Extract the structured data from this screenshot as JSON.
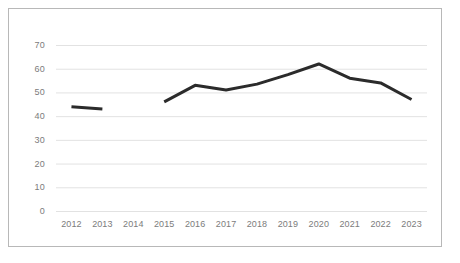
{
  "chart_data": {
    "type": "line",
    "title": "",
    "subtitle": "",
    "xlabel": "",
    "ylabel": "",
    "categories": [
      "2012",
      "2013",
      "2014",
      "2015",
      "2016",
      "2017",
      "2018",
      "2019",
      "2020",
      "2021",
      "2022",
      "2023"
    ],
    "values": [
      44,
      43,
      null,
      46,
      53,
      51,
      53.5,
      57.5,
      62,
      56,
      54,
      47
    ],
    "series": [
      {
        "name": "",
        "values": [
          44,
          43,
          null,
          46,
          53,
          51,
          53.5,
          57.5,
          62,
          56,
          54,
          47
        ]
      }
    ],
    "ylim": [
      0,
      70
    ],
    "yticks": [
      0,
      10,
      20,
      30,
      40,
      50,
      60,
      70
    ],
    "ytick_labels": [
      "0",
      "10",
      "20",
      "30",
      "40",
      "50",
      "60",
      "70"
    ],
    "xtick_labels": [
      "2012",
      "2013",
      "2014",
      "2015",
      "2016",
      "2017",
      "2018",
      "2019",
      "2020",
      "2021",
      "2022",
      "2023"
    ],
    "grid": true,
    "grid_axis": "y",
    "legend": false,
    "legend_position": "none",
    "annotations": [],
    "missing_points": [
      "2014"
    ],
    "line_color": "#2b2b2b",
    "grid_color": "#e2e2e2",
    "axis_label_color": "#7c7c7c",
    "background_color": "#ffffff",
    "border_color": "#b8b8b8"
  }
}
